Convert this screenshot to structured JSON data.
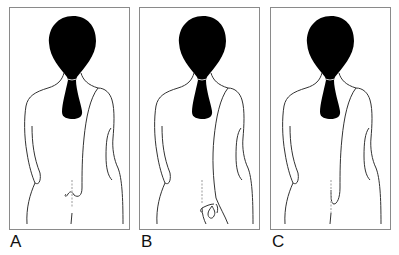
{
  "figure": {
    "panels": [
      {
        "id": "A",
        "label": "A",
        "pose": "hand behind back at lower spine, fingers curled"
      },
      {
        "id": "B",
        "label": "B",
        "pose": "hand behind back at sacrum holding a small loop"
      },
      {
        "id": "C",
        "label": "C",
        "pose": "hand behind back at lower spine, flat"
      }
    ]
  },
  "colors": {
    "hair": "#000000",
    "outline": "#333333",
    "frame": "#8a8a8a",
    "spine": "#b8b8b8",
    "background": "#ffffff"
  }
}
